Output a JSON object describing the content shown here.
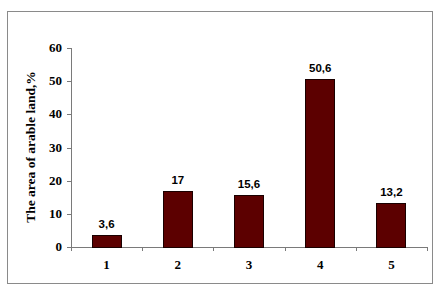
{
  "chart_data": {
    "type": "bar",
    "title": "",
    "xlabel": "",
    "ylabel": "The area of arable land,%",
    "categories": [
      "1",
      "2",
      "3",
      "4",
      "5"
    ],
    "values": [
      3.6,
      17,
      15.6,
      50.6,
      13.2
    ],
    "value_labels": [
      "3,6",
      "17",
      "15,6",
      "50,6",
      "13,2"
    ],
    "ylim": [
      0,
      60
    ],
    "yticks": [
      "0",
      "10",
      "20",
      "30",
      "40",
      "50",
      "60"
    ],
    "grid": false,
    "legend": null,
    "bar_color": "#5c0000"
  }
}
